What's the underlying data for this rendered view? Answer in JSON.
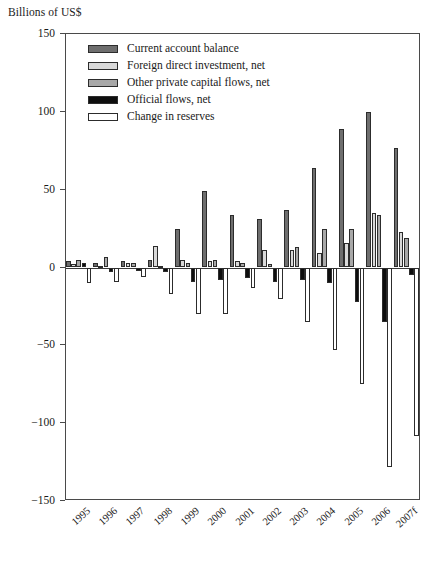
{
  "chart_data": {
    "type": "bar",
    "title": "",
    "ylabel": "Billions of US$",
    "xlabel": "",
    "ylim": [
      -150,
      150
    ],
    "yticks": [
      150,
      100,
      50,
      0,
      -50,
      -100,
      -150
    ],
    "ytick_labels": [
      "150",
      "100",
      "50",
      "0",
      "−50",
      "−100",
      "−150"
    ],
    "grid": false,
    "legend_position": "top-left inside axes",
    "categories": [
      "1995",
      "1996",
      "1997",
      "1998",
      "1999",
      "2000",
      "2001",
      "2002",
      "2003",
      "2004",
      "2005",
      "2006",
      "2007f"
    ],
    "series": [
      {
        "name": "Current account balance",
        "color": "#6e6e6e",
        "values": [
          4,
          3,
          4,
          5,
          25,
          49,
          34,
          31,
          37,
          64,
          89,
          100,
          77
        ]
      },
      {
        "name": "Foreign direct investment, net",
        "color": "#d9d9d9",
        "values": [
          2,
          1,
          3,
          14,
          5,
          4,
          4,
          11,
          11,
          9,
          16,
          35,
          23
        ]
      },
      {
        "name": "Other private capital flows, net",
        "color": "#a8a8a8",
        "values": [
          5,
          7,
          3,
          1,
          3,
          5,
          3,
          2,
          13,
          25,
          25,
          34,
          19
        ]
      },
      {
        "name": "Official flows, net",
        "color": "#0e0e0e",
        "values": [
          3,
          -3,
          -2,
          -3,
          -9,
          -8,
          -7,
          -9,
          -8,
          -10,
          -22,
          -35,
          -5
        ]
      },
      {
        "name": "Change in reserves",
        "color": "#ffffff",
        "values": [
          -10,
          -9,
          -6,
          -17,
          -30,
          -30,
          -13,
          -20,
          -35,
          -53,
          -75,
          -128,
          -108
        ]
      }
    ]
  },
  "legend": {
    "items": [
      {
        "label": "Current account balance",
        "color": "#6e6e6e"
      },
      {
        "label": "Foreign direct investment, net",
        "color": "#d9d9d9"
      },
      {
        "label": "Other private capital flows, net",
        "color": "#a8a8a8"
      },
      {
        "label": "Official flows, net",
        "color": "#0e0e0e"
      },
      {
        "label": "Change in reserves",
        "color": "#ffffff"
      }
    ]
  }
}
